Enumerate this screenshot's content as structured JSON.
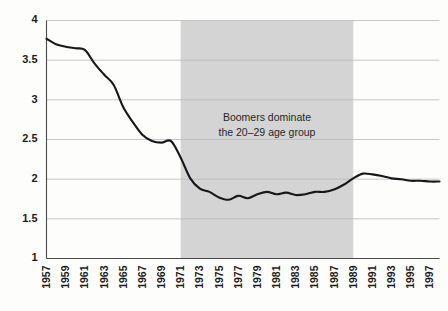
{
  "chart_data": {
    "type": "line",
    "title": "",
    "subtitle": "",
    "xlabel": "",
    "ylabel": "",
    "xlim": [
      1957,
      1998
    ],
    "ylim": [
      1,
      4
    ],
    "grid": true,
    "legend": "none",
    "x_tick_labels": [
      "1957",
      "1959",
      "1961",
      "1963",
      "1965",
      "1967",
      "1969",
      "1971",
      "1973",
      "1975",
      "1977",
      "1979",
      "1981",
      "1983",
      "1985",
      "1987",
      "1989",
      "1991",
      "1993",
      "1995",
      "1997"
    ],
    "y_tick_labels": [
      "1",
      "1.5",
      "2",
      "2.5",
      "3",
      "3.5",
      "4"
    ],
    "y_tick_values": [
      1,
      1.5,
      2,
      2.5,
      3,
      3.5,
      4
    ],
    "x": [
      1957,
      1958,
      1959,
      1960,
      1961,
      1962,
      1963,
      1964,
      1965,
      1966,
      1967,
      1968,
      1969,
      1970,
      1971,
      1972,
      1973,
      1974,
      1975,
      1976,
      1977,
      1978,
      1979,
      1980,
      1981,
      1982,
      1983,
      1984,
      1985,
      1986,
      1987,
      1988,
      1989,
      1990,
      1991,
      1992,
      1993,
      1994,
      1995,
      1996,
      1997,
      1998
    ],
    "series": [
      {
        "name": "Total fertility rate",
        "color": "#15181a",
        "values": [
          3.77,
          3.7,
          3.67,
          3.65,
          3.63,
          3.46,
          3.32,
          3.19,
          2.91,
          2.72,
          2.56,
          2.48,
          2.46,
          2.48,
          2.27,
          2.01,
          1.88,
          1.84,
          1.77,
          1.74,
          1.79,
          1.76,
          1.81,
          1.84,
          1.81,
          1.83,
          1.8,
          1.81,
          1.84,
          1.84,
          1.87,
          1.93,
          2.01,
          2.07,
          2.06,
          2.04,
          2.01,
          2.0,
          1.98,
          1.98,
          1.97,
          1.97
        ]
      }
    ],
    "shaded_band": {
      "label": "Boomers dominate the 20–29 age group",
      "annotation_lines": [
        "Boomers dominate",
        "the 20–29 age group"
      ],
      "x_start": 1971,
      "x_end": 1989,
      "color": "#d4d4d4"
    }
  },
  "colors": {
    "background": "#fdfdfb",
    "line": "#15181a",
    "band": "#d4d4d4",
    "grid": "#b9b9b9",
    "axis": "#4a4a4a",
    "text": "#1c1c1c"
  }
}
